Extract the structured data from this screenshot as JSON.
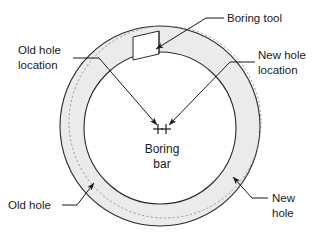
{
  "figure": {
    "type": "technical-diagram",
    "background_color": "#ffffff",
    "line_color": "#2b2b2b",
    "annulus_fill": "#ebebeb",
    "bore_fill": "#ffffff",
    "dashed_circle_color": "#8c8c8c"
  },
  "labels": {
    "boring_tool": "Boring tool",
    "old_hole_location_line1": "Old hole",
    "old_hole_location_line2": "location",
    "new_hole_location_line1": "New hole",
    "new_hole_location_line2": "location",
    "old_hole": "Old hole",
    "new_hole_line1": "New",
    "new_hole_line2": "hole",
    "boring_bar_line1": "Boring",
    "boring_bar_line2": "bar"
  },
  "geometry": {
    "new_hole_circle": {
      "cx": 160,
      "cy": 126,
      "r": 100,
      "note": "outer solid circle = new hole"
    },
    "old_hole_circle": {
      "cx": 165,
      "cy": 122,
      "r": 96,
      "note": "dashed circle = old hole location, offset"
    },
    "bore_circle": {
      "cx": 160,
      "cy": 128,
      "r": 76,
      "note": "inner solid circle = bored surface"
    },
    "old_hole_center_mark": {
      "x": 158,
      "y": 129
    },
    "new_hole_center_mark": {
      "x": 166,
      "y": 129
    },
    "boring_tool_notch": {
      "x": 133,
      "y": 36,
      "width": 26,
      "height": 24
    }
  }
}
